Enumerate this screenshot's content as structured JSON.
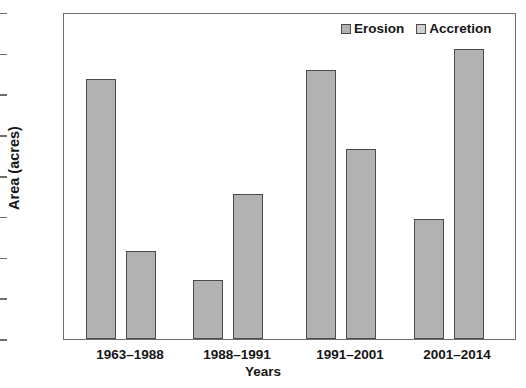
{
  "chart_data": {
    "type": "bar",
    "title": "",
    "xlabel": "Years",
    "ylabel": "Area (acres)",
    "categories": [
      "1963–1988",
      "1988–1991",
      "1991–2001",
      "2001–2014"
    ],
    "series": [
      {
        "name": "Erosion",
        "values": [
          638,
          145,
          662,
          294
        ]
      },
      {
        "name": "Accretion",
        "values": [
          216,
          356,
          466,
          712
        ]
      }
    ],
    "ylim": [
      0,
      800
    ],
    "yticks": [
      0,
      100,
      200,
      300,
      400,
      500,
      600,
      700,
      800
    ],
    "ytick_labels": [
      "0",
      "100",
      "200",
      "300",
      "400",
      "500",
      "600",
      "700",
      "800"
    ],
    "grid": false,
    "legend_position": "top-right",
    "legend_entries": [
      {
        "label": "Erosion",
        "swatch": "erosion-swatch",
        "color": "#b2b2b2"
      },
      {
        "label": "Accretion",
        "swatch": "accretion-swatch",
        "color": "#cfcfcf"
      }
    ],
    "bar_color": "#b2b2b2",
    "bar_edge_color": "#4a4a4a",
    "axis_color": "#6e6e6e"
  },
  "caption": ""
}
